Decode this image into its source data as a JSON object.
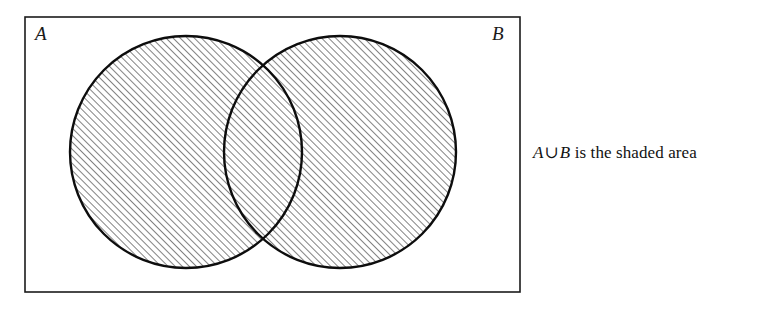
{
  "figure": {
    "background_color": "#ffffff",
    "line_color": "#000000",
    "hatch_color": "#1a1a1a"
  },
  "universe_rect": {
    "name": "universal-set-rectangle",
    "x": 25,
    "y": 17,
    "width": 495,
    "height": 275,
    "stroke_width": 1.6
  },
  "sets": [
    {
      "id": "A",
      "label": "A",
      "label_position": "top-left",
      "circle": {
        "cx": 186,
        "cy": 152,
        "r": 116
      },
      "shaded": true
    },
    {
      "id": "B",
      "label": "B",
      "label_position": "top-right",
      "circle": {
        "cx": 340,
        "cy": 152,
        "r": 116
      },
      "shaded": true
    }
  ],
  "hatching": {
    "angle_degrees": 45,
    "direction": "lower-left-to-upper-right",
    "spacing_px": 5,
    "stroke_width": 1.1,
    "region": "union"
  },
  "caption": {
    "full_text": "A ∪ B is the shaded area",
    "set_a": "A",
    "operator": "∪",
    "set_b": "B",
    "tail": "is the shaded area"
  }
}
